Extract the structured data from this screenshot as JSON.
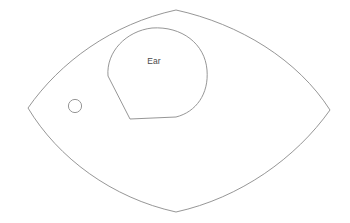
{
  "document": {
    "type": "sewing-pattern-template",
    "background_color": "#ffffff",
    "line_color": "#8a8a8a",
    "text_color": "#4a4a4a",
    "width": 350,
    "height": 223
  },
  "pieces": {
    "outer": {
      "name": "outer-body-piece",
      "shape": "pointed-oval",
      "left_tip": [
        28,
        108
      ],
      "right_tip": [
        330,
        110
      ],
      "top_peak": [
        176,
        10
      ],
      "bottom_peak": [
        176,
        212
      ],
      "path": "M 28 108 C 60 62, 112 24, 176 10 C 240 24, 298 60, 330 110 C 296 158, 240 198, 176 212 C 112 198, 58 158, 28 108 Z"
    },
    "inner": {
      "name": "ear-piece",
      "label": "Ear",
      "label_position": [
        154,
        62
      ],
      "path": "M 108 76 C 106 52, 126 31, 152 28 C 182 26, 205 44, 207 70 C 209 94, 196 112, 176 117 L 130 119 L 108 76 Z"
    },
    "hole": {
      "name": "hole-marker",
      "center": [
        75,
        106
      ],
      "radius": 6.6
    }
  },
  "labels": {
    "ear": "Ear"
  }
}
